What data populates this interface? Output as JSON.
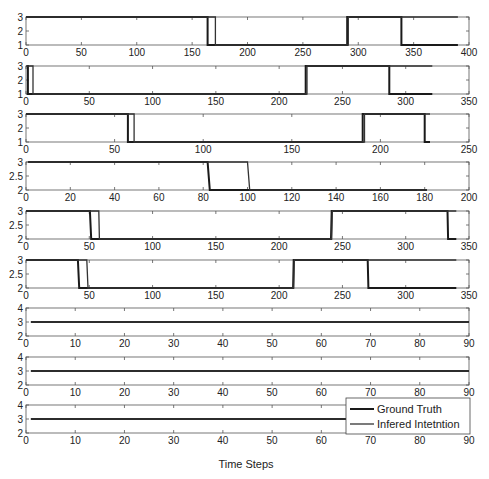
{
  "chart_data": {
    "type": "line",
    "xlabel": "Time Steps",
    "legend": {
      "placement": "bottom-right",
      "entries": [
        "Ground Truth",
        "Infered Intetntion"
      ]
    },
    "subplots": [
      {
        "xlim": [
          0,
          400
        ],
        "ylim": [
          1,
          3
        ],
        "xticks": [
          0,
          50,
          100,
          150,
          200,
          250,
          300,
          350,
          400
        ],
        "yticks": [
          1,
          2,
          3
        ],
        "series": [
          {
            "name": "Ground Truth",
            "x": [
              0,
              164,
              164,
              290,
              290,
              339,
              339,
              390
            ],
            "y": [
              3,
              3,
              1,
              1,
              3,
              3,
              1,
              1
            ]
          },
          {
            "name": "Infered Intetntion",
            "x": [
              0,
              171,
              171,
              291,
              291,
              340,
              340,
              390
            ],
            "y": [
              3,
              3,
              1,
              1,
              3,
              3,
              3,
              3
            ]
          }
        ]
      },
      {
        "xlim": [
          0,
          350
        ],
        "ylim": [
          1,
          3
        ],
        "xticks": [
          0,
          50,
          100,
          150,
          200,
          250,
          300,
          350
        ],
        "yticks": [
          1,
          2,
          3
        ],
        "series": [
          {
            "name": "Ground Truth",
            "x": [
              0.5,
              1.5,
              1.5,
              221,
              221,
              287,
              287,
              321
            ],
            "y": [
              3,
              3,
              1,
              1,
              3,
              3,
              1,
              1
            ]
          },
          {
            "name": "Infered Intetntion",
            "x": [
              0.5,
              5.5,
              5.5,
              222,
              222,
              288,
              288,
              321
            ],
            "y": [
              3,
              3,
              1,
              1,
              3,
              3,
              3,
              3
            ]
          }
        ]
      },
      {
        "xlim": [
          0,
          250
        ],
        "ylim": [
          1,
          3
        ],
        "xticks": [
          0,
          50,
          100,
          150,
          200,
          250
        ],
        "yticks": [
          1,
          2,
          3
        ],
        "series": [
          {
            "name": "Ground Truth",
            "x": [
              0,
              57.5,
              57.5,
              190,
              190,
              225,
              225,
              228
            ],
            "y": [
              3,
              3,
              1,
              1,
              3,
              3,
              1,
              1
            ]
          },
          {
            "name": "Infered Intetntion",
            "x": [
              0,
              61,
              61,
              191,
              191,
              226,
              226,
              228
            ],
            "y": [
              3,
              3,
              1,
              1,
              3,
              3,
              3,
              3
            ]
          }
        ]
      },
      {
        "xlim": [
          0,
          200
        ],
        "ylim": [
          2,
          3
        ],
        "xticks": [
          0,
          20,
          40,
          60,
          80,
          100,
          120,
          140,
          160,
          180,
          200
        ],
        "yticks": [
          2,
          2.5,
          3
        ],
        "series": [
          {
            "name": "Ground Truth",
            "x": [
              1,
              82,
              83,
              181
            ],
            "y": [
              3,
              3,
              2,
              2
            ]
          },
          {
            "name": "Infered Intetntion",
            "x": [
              1,
              100,
              101,
              181
            ],
            "y": [
              3,
              3,
              2,
              2
            ]
          }
        ]
      },
      {
        "xlim": [
          0,
          350
        ],
        "ylim": [
          2,
          3
        ],
        "xticks": [
          0,
          50,
          100,
          150,
          200,
          250,
          300,
          350
        ],
        "yticks": [
          2,
          2.5,
          3
        ],
        "series": [
          {
            "name": "Ground Truth",
            "x": [
              0,
              50.5,
              51.5,
              241,
              241.5,
              333,
              333.5,
              340
            ],
            "y": [
              3,
              3,
              2,
              2,
              3,
              3,
              2,
              2
            ]
          },
          {
            "name": "Infered Intetntion",
            "x": [
              0,
              57.5,
              58,
              241.5,
              242,
              333.5,
              334,
              340
            ],
            "y": [
              3,
              3,
              2,
              2,
              3,
              3,
              3,
              3
            ]
          }
        ]
      },
      {
        "xlim": [
          0,
          350
        ],
        "ylim": [
          2,
          3
        ],
        "xticks": [
          0,
          50,
          100,
          150,
          200,
          250,
          300,
          350
        ],
        "yticks": [
          2,
          2.5,
          3
        ],
        "series": [
          {
            "name": "Ground Truth",
            "x": [
              0,
              41,
              42,
              211,
              211.5,
              270,
              270.5,
              340
            ],
            "y": [
              3,
              3,
              2,
              2,
              3,
              3,
              2,
              2
            ]
          },
          {
            "name": "Infered Intetntion",
            "x": [
              0,
              48,
              49,
              211.5,
              212,
              270.5,
              271,
              340
            ],
            "y": [
              3,
              3,
              2,
              2,
              3,
              3,
              3,
              3
            ]
          }
        ]
      },
      {
        "xlim": [
          0,
          90
        ],
        "ylim": [
          2,
          4
        ],
        "xticks": [
          0,
          10,
          20,
          30,
          40,
          50,
          60,
          70,
          80,
          90
        ],
        "yticks": [
          2,
          3,
          4
        ],
        "series": [
          {
            "name": "Ground Truth",
            "x": [
              1,
              90
            ],
            "y": [
              3,
              3
            ]
          },
          {
            "name": "Infered Intetntion",
            "x": [
              1,
              90
            ],
            "y": [
              3,
              3
            ]
          }
        ]
      },
      {
        "xlim": [
          0,
          90
        ],
        "ylim": [
          2,
          4
        ],
        "xticks": [
          0,
          10,
          20,
          30,
          40,
          50,
          60,
          70,
          80,
          90
        ],
        "yticks": [
          2,
          3,
          4
        ],
        "series": [
          {
            "name": "Ground Truth",
            "x": [
              1,
              90
            ],
            "y": [
              3,
              3
            ]
          },
          {
            "name": "Infered Intetntion",
            "x": [
              1,
              90
            ],
            "y": [
              3,
              3
            ]
          }
        ]
      },
      {
        "xlim": [
          0,
          90
        ],
        "ylim": [
          2,
          4
        ],
        "xticks": [
          0,
          10,
          20,
          30,
          40,
          50,
          60,
          70,
          80,
          90
        ],
        "yticks": [
          2,
          3,
          4
        ],
        "series": [
          {
            "name": "Ground Truth",
            "x": [
              1,
              90
            ],
            "y": [
              3,
              3
            ]
          },
          {
            "name": "Infered Intetntion",
            "x": [
              1,
              90
            ],
            "y": [
              3,
              3
            ]
          }
        ]
      }
    ]
  }
}
